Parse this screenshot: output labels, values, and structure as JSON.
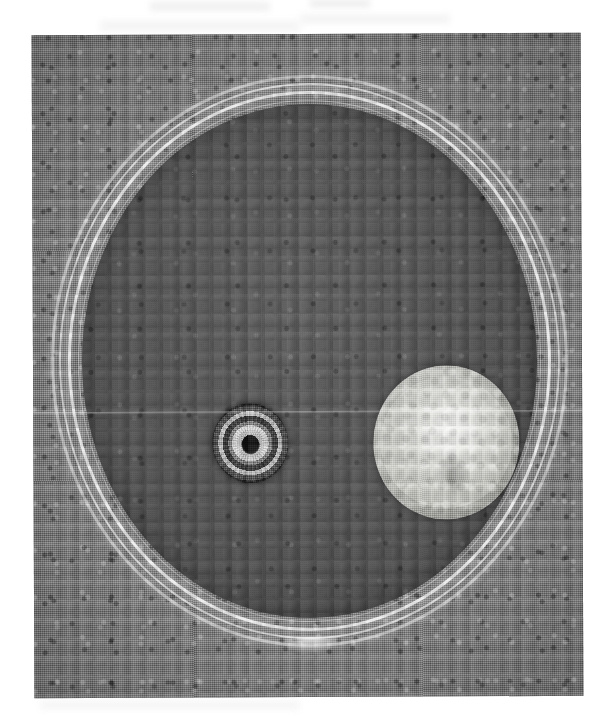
{
  "figure": {
    "kind": "scanned-photograph",
    "caption": "",
    "photo_tone": "black-and-white halftone print"
  },
  "colors": {
    "page_background": "#ffffff",
    "table_background": "#8b8b8b",
    "agar_surface": "#6e6e6e",
    "dish_rim_highlight": "#ffffff",
    "dark_colony": "#1e1e1e",
    "dark_colony_ring": "#dedede",
    "light_colony": "#d2d2cd",
    "light_colony_center": "#f7f7f5"
  },
  "photo": {
    "left": 33,
    "top": 34,
    "width": 549,
    "height": 663,
    "rotation_deg": -0.25
  },
  "dish": {
    "label": "petri-dish",
    "left": 18,
    "top": 41,
    "width": 517,
    "height": 572,
    "rings": [
      {
        "name": "rim-outer",
        "opacity": 0.58
      },
      {
        "name": "rim-second",
        "opacity": 0.72
      },
      {
        "name": "rim-third",
        "opacity": 0.88
      },
      {
        "name": "rim-fourth",
        "opacity": 0.4
      }
    ],
    "tab": "bottom-centre-glass-tab"
  },
  "colonies": [
    {
      "id": "dark-colony",
      "label": "dark zonate colony",
      "position": "left-of-centre",
      "left": 130,
      "top": 299,
      "width": 76,
      "height": 80,
      "appearance": "small dark colony with concentric light and dark zonation rings and a black centre",
      "rotation_deg": -8
    },
    {
      "id": "light-colony",
      "label": "pale cottony colony",
      "position": "right-of-centre",
      "left": 291,
      "top": 262,
      "width": 146,
      "height": 154,
      "appearance": "large pale convex cottony colony with a bright raised centre",
      "rotation_deg": 3
    }
  ],
  "artifacts": {
    "scanline_top": 377,
    "smudges": [
      {
        "left": 150,
        "top": 2,
        "width": 120,
        "height": 9
      },
      {
        "left": 310,
        "top": 0,
        "width": 60,
        "height": 7
      },
      {
        "left": 100,
        "top": 20,
        "width": 200,
        "height": 12
      },
      {
        "left": 300,
        "top": 14,
        "width": 150,
        "height": 10
      },
      {
        "left": 40,
        "top": 700,
        "width": 260,
        "height": 10
      }
    ]
  }
}
